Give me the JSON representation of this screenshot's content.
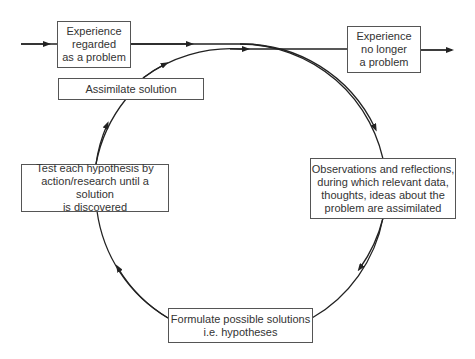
{
  "diagram": {
    "type": "cycle",
    "boxes": {
      "start": "Experience\nregarded\nas a problem",
      "end": "Experience\nno longer\na problem",
      "observations": "Observations and reflections,\nduring which relevant data,\nthoughts, ideas about the\nproblem are assimilated",
      "formulate": "Formulate possible solutions\ni.e. hypotheses",
      "test": "Test each hypothesis by\naction/research until a solution\nis discovered",
      "assimilate": "Assimilate solution"
    },
    "flow": [
      "start",
      "observations",
      "formulate",
      "test",
      "assimilate",
      "end"
    ],
    "colors": {
      "line": "#222222",
      "box_border": "#555555",
      "text": "#333333"
    }
  }
}
